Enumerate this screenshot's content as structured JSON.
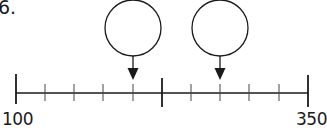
{
  "question": {
    "number": "6."
  },
  "number_line": {
    "min_label": "100",
    "max_label": "350",
    "min": 100,
    "max": 350,
    "midpoint": 225,
    "minor_ticks_per_half": 4,
    "line_color": "#1a1a1a"
  },
  "answer_boxes": [
    {
      "name": "answer-circle-1",
      "points_to_tick": 4,
      "points_to_value": 200,
      "value": ""
    },
    {
      "name": "answer-circle-2",
      "points_to_tick": 7,
      "points_to_value": 275,
      "value": ""
    }
  ]
}
